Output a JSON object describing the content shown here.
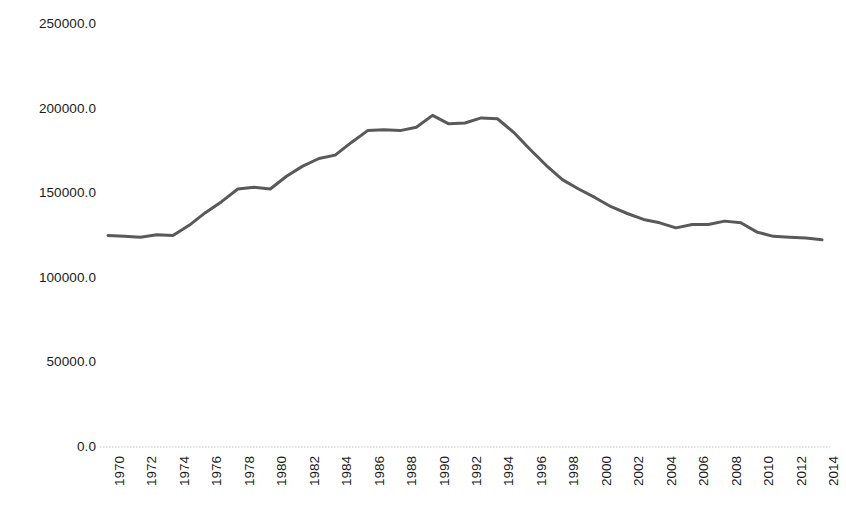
{
  "chart_data": {
    "type": "line",
    "title": "",
    "subtitle": "",
    "xlabel": "",
    "ylabel": "",
    "legend": [],
    "legend_position": "none",
    "grid": false,
    "axis_line_color": "#d9d9d9",
    "line_color": "#595959",
    "line_width": 3,
    "ylim": [
      0,
      250000
    ],
    "yticks": [
      0,
      50000,
      100000,
      150000,
      200000,
      250000
    ],
    "ytick_labels": [
      "0.0",
      "50000.0",
      "100000.0",
      "150000.0",
      "200000.0",
      "250000.0"
    ],
    "xlim": [
      1970,
      2014
    ],
    "xticks": [
      1970,
      1972,
      1974,
      1976,
      1978,
      1980,
      1982,
      1984,
      1986,
      1988,
      1990,
      1992,
      1994,
      1996,
      1998,
      2000,
      2002,
      2004,
      2006,
      2008,
      2010,
      2012,
      2014
    ],
    "xtick_labels": [
      "1970",
      "1972",
      "1974",
      "1976",
      "1978",
      "1980",
      "1982",
      "1984",
      "1986",
      "1988",
      "1990",
      "1992",
      "1994",
      "1996",
      "1998",
      "2000",
      "2002",
      "2004",
      "2006",
      "2008",
      "2010",
      "2012",
      "2014"
    ],
    "xtick_rotation": 90,
    "x": [
      1970,
      1971,
      1972,
      1973,
      1974,
      1975,
      1976,
      1977,
      1978,
      1979,
      1980,
      1981,
      1982,
      1983,
      1984,
      1985,
      1986,
      1987,
      1988,
      1989,
      1990,
      1991,
      1992,
      1993,
      1994,
      1995,
      1996,
      1997,
      1998,
      1999,
      2000,
      2001,
      2002,
      2003,
      2004,
      2005,
      2006,
      2007,
      2008,
      2009,
      2010,
      2011,
      2012,
      2013,
      2014
    ],
    "values": [
      125000,
      124500,
      124000,
      125500,
      125000,
      131000,
      138500,
      145000,
      152500,
      153500,
      152500,
      160000,
      166000,
      170500,
      172500,
      180000,
      187000,
      187500,
      187000,
      189000,
      196000,
      191000,
      191500,
      194500,
      194000,
      186000,
      176000,
      166500,
      158000,
      152500,
      147500,
      142000,
      138000,
      134500,
      132500,
      129500,
      131500,
      131500,
      133500,
      132500,
      127000,
      124500,
      124000,
      123500,
      122500
    ],
    "series": [
      {
        "name": "series-1",
        "values": [
          125000,
          124500,
          124000,
          125500,
          125000,
          131000,
          138500,
          145000,
          152500,
          153500,
          152500,
          160000,
          166000,
          170500,
          172500,
          180000,
          187000,
          187500,
          187000,
          189000,
          196000,
          191000,
          191500,
          194500,
          194000,
          186000,
          176000,
          166500,
          158000,
          152500,
          147500,
          142000,
          138000,
          134500,
          132500,
          129500,
          131500,
          131500,
          133500,
          132500,
          127000,
          124500,
          124000,
          123500,
          122500
        ]
      }
    ]
  }
}
